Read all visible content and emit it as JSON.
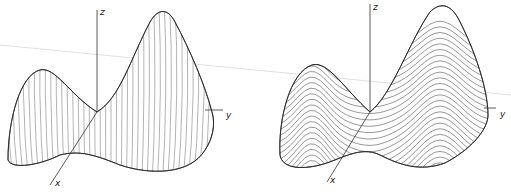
{
  "figure": {
    "background_line": {
      "x1": 0,
      "y1": 45,
      "x2": 511,
      "y2": 95,
      "color": "#d8d8d8"
    },
    "panels": [
      {
        "id": "left",
        "style": "vertical-hatching",
        "axes": {
          "z": {
            "label": "z",
            "x1": 97,
            "y1": 112,
            "x2": 97,
            "y2": 10,
            "label_x": 100,
            "label_y": 15
          },
          "y": {
            "label": "y",
            "x1": 205,
            "y1": 110,
            "x2": 223,
            "y2": 110,
            "label_x": 226,
            "label_y": 118
          },
          "x": {
            "label": "x",
            "x1": 97,
            "y1": 112,
            "x2": 50,
            "y2": 185,
            "label_x": 55,
            "label_y": 186
          }
        },
        "outline": "M8,160 C8,120 20,75 40,70 C55,66 70,95 97,112 C120,98 130,60 150,22 C158,8 168,8 175,22 C190,50 205,85 212,112 C216,125 212,140 205,150 C190,175 150,175 120,165 C95,155 80,150 60,155 C40,165 12,170 8,160 Z",
        "hatch_x_start": 10,
        "hatch_x_end": 212,
        "hatch_count": 38
      },
      {
        "id": "right",
        "style": "horizontal-contours",
        "axes": {
          "z": {
            "label": "z",
            "x1": 370,
            "y1": 112,
            "x2": 370,
            "y2": 4,
            "label_x": 373,
            "label_y": 10
          },
          "y": {
            "label": "y",
            "x1": 484,
            "y1": 108,
            "x2": 496,
            "y2": 108,
            "label_x": 500,
            "label_y": 117
          },
          "x": {
            "label": "x",
            "x1": 370,
            "y1": 112,
            "x2": 327,
            "y2": 182,
            "label_x": 330,
            "label_y": 183
          }
        },
        "outline": "M280,155 C278,120 290,72 312,65 C328,60 345,90 370,112 C392,95 410,40 430,12 C440,2 450,4 458,18 C475,50 488,90 488,115 C488,130 470,150 445,163 C420,172 400,165 380,155 C360,145 340,160 320,165 C300,170 282,168 280,155 Z",
        "contour_count": 28
      }
    ]
  }
}
